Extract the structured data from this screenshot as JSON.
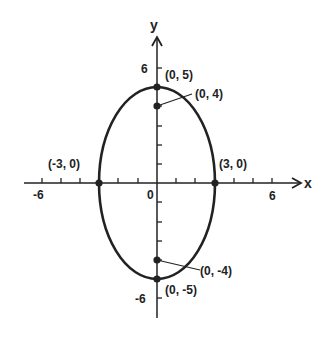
{
  "diagram": {
    "type": "ellipse-graph",
    "axes": {
      "x_label": "x",
      "y_label": "y",
      "x_ticks": [
        "-6",
        "0",
        "6"
      ],
      "y_ticks": [
        "6",
        "-6"
      ],
      "range": [
        -7,
        7
      ]
    },
    "ellipse": {
      "center": [
        0,
        0
      ],
      "semi_major_y": 5,
      "semi_minor_x": 3
    },
    "points": [
      {
        "label": "(0, 5)",
        "x": 0,
        "y": 5
      },
      {
        "label": "(0, 4)",
        "x": 0,
        "y": 4
      },
      {
        "label": "(-3, 0)",
        "x": -3,
        "y": 0
      },
      {
        "label": "(3, 0)",
        "x": 3,
        "y": 0
      },
      {
        "label": "(0, -4)",
        "x": 0,
        "y": -4
      },
      {
        "label": "(0, -5)",
        "x": 0,
        "y": -5
      }
    ],
    "colors": {
      "line": "#222222",
      "background": "#ffffff"
    }
  }
}
